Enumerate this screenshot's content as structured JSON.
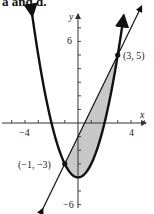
{
  "caption": "a and d.",
  "chart_data": {
    "type": "line",
    "title": "",
    "xlabel": "x",
    "ylabel": "y",
    "xlim": [
      -5.8,
      5.5
    ],
    "ylim": [
      -6.5,
      8.5
    ],
    "x_ticks": [
      -5,
      -4,
      -3,
      -2,
      -1,
      1,
      2,
      3,
      4,
      5
    ],
    "x_tick_labels": {
      "-4": "−4",
      "4": "4"
    },
    "y_ticks": [
      -6,
      -5,
      -4,
      -3,
      -2,
      -1,
      1,
      2,
      3,
      4,
      5,
      6,
      7
    ],
    "y_tick_labels": {
      "6": "6",
      "-6": "−6"
    },
    "grid": false,
    "series": [
      {
        "name": "parabola",
        "equation": "y = x^2 - 4",
        "style": "thick"
      },
      {
        "name": "line",
        "equation": "y = 2x - 1",
        "style": "thin"
      }
    ],
    "shaded_region": {
      "between": [
        "line",
        "parabola"
      ],
      "x_from": -1,
      "x_to": 3,
      "color": "#c8c8c8"
    },
    "points": [
      {
        "x": -1,
        "y": -3,
        "label": "(−1, −3)"
      },
      {
        "x": 3,
        "y": 5,
        "label": "(3, 5)"
      }
    ]
  },
  "labels": {
    "x_axis": "x",
    "y_axis": "y",
    "xtick_neg4": "−4",
    "xtick_4": "4",
    "ytick_6": "6",
    "ytick_neg6": "−6",
    "point_a": "(−1, −3)",
    "point_b": "(3, 5)"
  },
  "colors": {
    "curve": "#111111",
    "shade": "#c8c8c8",
    "axis": "#333333"
  }
}
